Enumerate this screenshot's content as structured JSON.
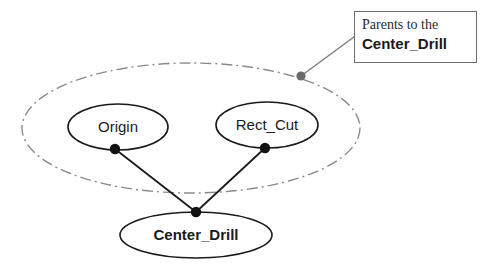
{
  "diagram": {
    "type": "parent-child-relationship-graph",
    "group_region": {
      "name": "parents-group-ellipse",
      "style": "dash-dot",
      "color": "#8a8a8a",
      "cx": 191,
      "cy": 128,
      "rx": 169,
      "ry": 65
    },
    "nodes": [
      {
        "id": "origin",
        "label": "Origin",
        "weight": "regular",
        "role": "parent",
        "cx": 118,
        "cy": 127,
        "rx": 50,
        "ry": 23,
        "anchor_x": 115,
        "anchor_y": 149
      },
      {
        "id": "rect_cut",
        "label": "Rect_Cut",
        "weight": "regular",
        "role": "parent",
        "cx": 267,
        "cy": 125,
        "rx": 51,
        "ry": 23,
        "anchor_x": 265,
        "anchor_y": 148
      },
      {
        "id": "center_drill",
        "label": "Center_Drill",
        "weight": "bold",
        "role": "child",
        "cx": 196,
        "cy": 235,
        "rx": 76,
        "ry": 23,
        "anchor_x": 196,
        "anchor_y": 212
      }
    ],
    "connectors": [
      {
        "name": "origin-to-center-drill",
        "x1": 115,
        "y1": 149,
        "x2": 196,
        "y2": 212
      },
      {
        "name": "rect-cut-to-center-drill",
        "x1": 265,
        "y1": 148,
        "x2": 196,
        "y2": 212
      }
    ],
    "leader": {
      "name": "callout-leader-line",
      "x1": 301,
      "y1": 76,
      "x2": 362,
      "y2": 31,
      "dot_x": 301,
      "dot_y": 76,
      "dot_color": "#6b6b6b"
    }
  },
  "callout": {
    "line1": "Parents to the",
    "line2": "Center_Drill"
  },
  "colors": {
    "stroke": "#1a1a1a",
    "group_stroke": "#8a8a8a",
    "box_border": "#6e6e6e",
    "dot": "#111111",
    "background": "#ffffff"
  }
}
